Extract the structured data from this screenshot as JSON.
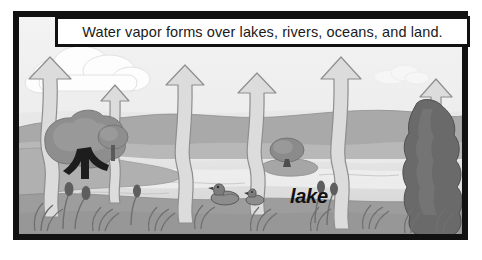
{
  "panel": {
    "caption": "Water vapor forms over lakes, rivers, oceans, and land.",
    "frame_color": "#111111",
    "caption_background": "#ffffff"
  },
  "scene": {
    "title": "water-cycle-evaporation-illustration",
    "style": "grayscale line art",
    "labels": [
      {
        "text": "lake",
        "style": "bold italic",
        "x": 271,
        "y": 168
      }
    ],
    "palette": {
      "sky": "#efefef",
      "cloud": "#fcfcfc",
      "far_hills": "#a9a9a9",
      "mid_hills": "#b6b6b6",
      "water": "#e2e2e2",
      "water_shadow": "#d2d2d2",
      "near_bank": "#a0a0a0",
      "foreground_bank": "#9a9a9a",
      "tree_canopy": "#8e8e8e",
      "tree_canopy_dark": "#6f6f6f",
      "conifer": "#6a6a6a",
      "trunk_dark": "#1d1d1d",
      "arrow_fill": "#dcdcdc",
      "arrow_stroke": "#8c8c8c",
      "outline": "#7a7a7a",
      "duck_body": "#8a8a8a",
      "duck_dark": "#3a3a3a"
    },
    "elements": {
      "clouds": [
        {
          "name": "cloud-large-left",
          "x": 18,
          "y": 44,
          "w": 112,
          "h": 36
        },
        {
          "name": "cloud-small-right",
          "x": 353,
          "y": 54,
          "w": 52,
          "h": 14
        }
      ],
      "arrows": [
        {
          "name": "vapor-arrow-1",
          "x": 30,
          "tip_y": 60,
          "base_y": 215,
          "size": "large"
        },
        {
          "name": "vapor-arrow-2",
          "x": 105,
          "tip_y": 82,
          "base_y": 200,
          "size": "small"
        },
        {
          "name": "vapor-arrow-3",
          "x": 172,
          "tip_y": 66,
          "base_y": 220,
          "size": "medium"
        },
        {
          "name": "vapor-arrow-4",
          "x": 243,
          "tip_y": 74,
          "base_y": 212,
          "size": "medium"
        },
        {
          "name": "vapor-arrow-5",
          "x": 330,
          "tip_y": 60,
          "base_y": 225,
          "size": "large"
        },
        {
          "name": "vapor-arrow-6",
          "x": 428,
          "tip_y": 78,
          "base_y": 195,
          "size": "medium"
        }
      ],
      "trees": [
        {
          "name": "tree-left-large",
          "x": 38,
          "y": 108
        },
        {
          "name": "bush-left-small",
          "x": 86,
          "y": 118
        },
        {
          "name": "tree-island",
          "x": 262,
          "y": 118
        },
        {
          "name": "conifer-right",
          "x": 398,
          "y": 78
        }
      ],
      "ducks": [
        {
          "name": "duck-adult",
          "x": 202,
          "y": 178
        },
        {
          "name": "duck-duckling",
          "x": 232,
          "y": 180
        }
      ],
      "cattails": [
        {
          "name": "cattail-cluster-left",
          "x": 48,
          "y": 168
        },
        {
          "name": "cattail-cluster-mid",
          "x": 118,
          "y": 170
        },
        {
          "name": "cattail-cluster-right",
          "x": 300,
          "y": 166
        }
      ],
      "grass_tufts": 9
    }
  }
}
